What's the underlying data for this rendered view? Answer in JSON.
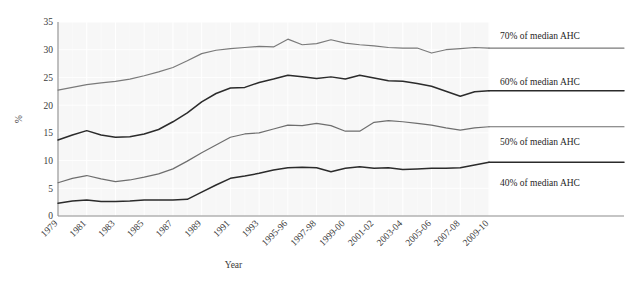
{
  "chart_data": {
    "type": "line",
    "title": "",
    "xlabel": "Year",
    "ylabel": "%",
    "ylim": [
      0,
      35
    ],
    "yticks": [
      0,
      5,
      10,
      15,
      20,
      25,
      30,
      35
    ],
    "grid": true,
    "legend_position": "inline-right",
    "x": [
      "1979",
      "1980",
      "1981",
      "1982",
      "1983",
      "1984",
      "1985",
      "1986",
      "1987",
      "1988",
      "1989",
      "1990",
      "1991",
      "1992",
      "1993",
      "1994-95",
      "1995-96",
      "1996-97",
      "1997-98",
      "1998-99",
      "1999-00",
      "2000-01",
      "2001-02",
      "2002-03",
      "2003-04",
      "2004-05",
      "2005-06",
      "2006-07",
      "2007-08",
      "2008-09",
      "2009-10"
    ],
    "xtick_labels": [
      "1979",
      "1981",
      "1983",
      "1985",
      "1987",
      "1989",
      "1991",
      "1993",
      "1995-96",
      "1997-98",
      "1999-00",
      "2001-02",
      "2003-04",
      "2005-06",
      "2007-08",
      "2009-10"
    ],
    "series": [
      {
        "name": "70% of median AHC",
        "label": "70% of median AHC",
        "color": "#7a7a7a",
        "values": [
          22.7,
          23.2,
          23.7,
          24.0,
          24.3,
          24.7,
          25.3,
          26.0,
          26.8,
          28.0,
          29.3,
          29.9,
          30.2,
          30.4,
          30.6,
          30.5,
          31.9,
          30.9,
          31.1,
          31.8,
          31.2,
          30.9,
          30.7,
          30.4,
          30.3,
          30.3,
          29.4,
          30.0,
          30.2,
          30.4,
          30.3
        ]
      },
      {
        "name": "60% of median AHC",
        "label": "60% of median AHC",
        "color": "#2b2b2b",
        "values": [
          13.7,
          14.6,
          15.4,
          14.6,
          14.2,
          14.3,
          14.8,
          15.6,
          17.0,
          18.6,
          20.6,
          22.1,
          23.1,
          23.2,
          24.1,
          24.7,
          25.4,
          25.1,
          24.8,
          25.1,
          24.7,
          25.4,
          24.9,
          24.4,
          24.3,
          23.9,
          23.4,
          22.5,
          21.6,
          22.4,
          22.6
        ]
      },
      {
        "name": "50% of median AHC",
        "label": "50% of median AHC",
        "color": "#6e6e6e",
        "values": [
          6.0,
          6.8,
          7.3,
          6.7,
          6.2,
          6.5,
          7.0,
          7.6,
          8.5,
          9.9,
          11.4,
          12.8,
          14.2,
          14.8,
          15.0,
          15.7,
          16.4,
          16.3,
          16.7,
          16.3,
          15.3,
          15.3,
          16.9,
          17.2,
          17.0,
          16.7,
          16.4,
          15.9,
          15.5,
          15.9,
          16.1
        ]
      },
      {
        "name": "40% of median AHC",
        "label": "40% of median AHC",
        "color": "#2b2b2b",
        "values": [
          2.3,
          2.7,
          2.9,
          2.6,
          2.6,
          2.7,
          2.9,
          2.9,
          2.9,
          3.0,
          4.3,
          5.6,
          6.8,
          7.2,
          7.7,
          8.3,
          8.7,
          8.8,
          8.7,
          8.0,
          8.6,
          8.9,
          8.6,
          8.7,
          8.4,
          8.5,
          8.6,
          8.6,
          8.7,
          9.2,
          9.7
        ]
      }
    ],
    "series_label_y": [
      39,
      85,
      145,
      186
    ]
  }
}
